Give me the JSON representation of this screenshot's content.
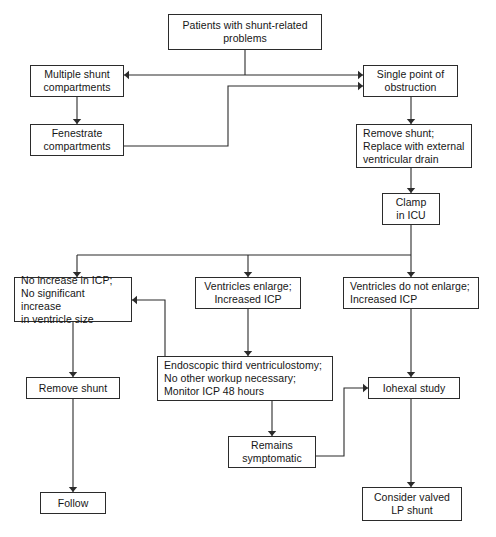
{
  "diagram": {
    "canvas": {
      "width": 496,
      "height": 537
    },
    "style": {
      "box_border": "#2b2b2b",
      "line_color": "#2b2b2b",
      "background": "#ffffff",
      "text_color": "#161616"
    }
  },
  "nodes": {
    "patients": {
      "label": "Patients with shunt-related\nproblems",
      "x": 168,
      "y": 14,
      "w": 154,
      "h": 36,
      "align": "center"
    },
    "multiple_shunt": {
      "label": "Multiple shunt\ncompartments",
      "x": 30,
      "y": 65,
      "w": 94,
      "h": 32,
      "align": "center"
    },
    "single_point": {
      "label": "Single point of\nobstruction",
      "x": 363,
      "y": 65,
      "w": 95,
      "h": 32,
      "align": "center"
    },
    "fenestrate": {
      "label": "Fenestrate\ncompartments",
      "x": 30,
      "y": 124,
      "w": 94,
      "h": 32,
      "align": "center"
    },
    "remove_replace": {
      "label": "Remove shunt;\nReplace with external\nventricular drain",
      "x": 356,
      "y": 124,
      "w": 116,
      "h": 44,
      "align": "left"
    },
    "clamp_icu": {
      "label": "Clamp\nin ICU",
      "x": 382,
      "y": 193,
      "w": 58,
      "h": 32,
      "align": "center"
    },
    "no_increase": {
      "label": "No increase in ICP;\nNo significant increase\nin ventricle size",
      "x": 14,
      "y": 277,
      "w": 118,
      "h": 45,
      "align": "left"
    },
    "ventricles_enlarge": {
      "label": "Ventricles enlarge;\nIncreased ICP",
      "x": 195,
      "y": 277,
      "w": 106,
      "h": 32,
      "align": "center"
    },
    "ventricles_not_enlarge": {
      "label": "Ventricles do not enlarge;\nIncreased ICP",
      "x": 343,
      "y": 277,
      "w": 136,
      "h": 32,
      "align": "left"
    },
    "endoscopic": {
      "label": "Endoscopic third ventriculostomy;\nNo other workup necessary;\nMonitor ICP 48 hours",
      "x": 157,
      "y": 356,
      "w": 176,
      "h": 45,
      "align": "left"
    },
    "remove_shunt": {
      "label": "Remove shunt",
      "x": 26,
      "y": 377,
      "w": 94,
      "h": 22,
      "align": "center"
    },
    "iohexal": {
      "label": "Iohexal study",
      "x": 368,
      "y": 377,
      "w": 92,
      "h": 22,
      "align": "center"
    },
    "remains_symptomatic": {
      "label": "Remains\nsymptomatic",
      "x": 228,
      "y": 436,
      "w": 88,
      "h": 32,
      "align": "center"
    },
    "follow": {
      "label": "Follow",
      "x": 40,
      "y": 492,
      "w": 66,
      "h": 22,
      "align": "center"
    },
    "consider_valved": {
      "label": "Consider valved\nLP shunt",
      "x": 362,
      "y": 487,
      "w": 100,
      "h": 34,
      "align": "center"
    }
  },
  "edges": [
    {
      "name": "patients-to-split",
      "points": "245,50 245,75"
    },
    {
      "name": "split-to-multiple-shunt",
      "points": "245,75 124,75",
      "arrow": "left"
    },
    {
      "name": "split-to-single-point",
      "points": "245,75 363,75",
      "arrow": "right"
    },
    {
      "name": "multiple-to-fenestrate",
      "points": "77,97 77,124",
      "arrow": "down"
    },
    {
      "name": "fenestrate-to-single-point",
      "points": "124,146 228,146 228,86 363,86",
      "arrow": "right"
    },
    {
      "name": "single-point-to-remove-replace",
      "points": "411,97 411,124",
      "arrow": "down"
    },
    {
      "name": "remove-replace-to-clamp",
      "points": "411,168 411,193",
      "arrow": "down"
    },
    {
      "name": "clamp-to-distributor",
      "points": "411,225 411,255",
      "arrow": "none"
    },
    {
      "name": "distributor-bar",
      "points": "77,255 411,255"
    },
    {
      "name": "distributor-to-no-increase",
      "points": "77,255 77,277",
      "arrow": "down"
    },
    {
      "name": "distributor-to-ventricles-enlarge",
      "points": "248,255 248,277",
      "arrow": "down"
    },
    {
      "name": "distributor-to-ventricles-not-enlarge",
      "points": "411,255 411,277",
      "arrow": "down"
    },
    {
      "name": "no-increase-to-remove-shunt",
      "points": "73,322 73,377",
      "arrow": "down"
    },
    {
      "name": "ventricles-enlarge-to-endoscopic",
      "points": "248,309 248,356",
      "arrow": "down"
    },
    {
      "name": "endoscopic-to-no-increase",
      "points": "165,356 165,300 132,300",
      "arrow": "left"
    },
    {
      "name": "endoscopic-to-remains-symptomatic",
      "points": "272,401 272,436",
      "arrow": "down"
    },
    {
      "name": "remains-symptomatic-to-iohexal",
      "points": "316,456 344,456 344,388 368,388",
      "arrow": "right"
    },
    {
      "name": "ventricles-not-enlarge-to-iohexal",
      "points": "411,309 411,377",
      "arrow": "down"
    },
    {
      "name": "remove-shunt-to-follow",
      "points": "73,399 73,492",
      "arrow": "down"
    },
    {
      "name": "iohexal-to-consider-valved",
      "points": "411,399 411,487",
      "arrow": "down"
    }
  ]
}
